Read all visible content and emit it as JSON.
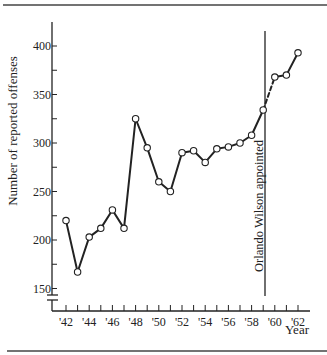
{
  "chart_data": {
    "type": "line",
    "title": "",
    "xlabel": "Year",
    "ylabel": "Number of reported offenses",
    "x": [
      1942,
      1943,
      1944,
      1945,
      1946,
      1947,
      1948,
      1949,
      1950,
      1951,
      1952,
      1953,
      1954,
      1955,
      1956,
      1957,
      1958,
      1959,
      1960,
      1961,
      1962
    ],
    "series": [
      {
        "name": "Reported offenses",
        "values": [
          220,
          167,
          203,
          212,
          231,
          212,
          325,
          295,
          260,
          250,
          290,
          292,
          280,
          294,
          296,
          300,
          308,
          334,
          368,
          370,
          393
        ],
        "dashed_segment": [
          1959,
          1960
        ],
        "marker": "open-circle"
      }
    ],
    "xticks": [
      1942,
      1943,
      1944,
      1945,
      1946,
      1947,
      1948,
      1949,
      1950,
      1951,
      1952,
      1953,
      1954,
      1955,
      1956,
      1957,
      1958,
      1959,
      1960,
      1961,
      1962
    ],
    "xtick_labels": [
      "'42",
      "'44",
      "'46",
      "'48",
      "'50",
      "'52",
      "'54",
      "'56",
      "'58",
      "'60",
      "'62"
    ],
    "xtick_label_years": [
      1942,
      1944,
      1946,
      1948,
      1950,
      1952,
      1954,
      1956,
      1958,
      1960,
      1962
    ],
    "yticks": [
      150,
      175,
      200,
      225,
      250,
      275,
      300,
      325,
      350,
      375,
      400
    ],
    "ytick_labels": [
      "150",
      "200",
      "250",
      "300",
      "350",
      "400"
    ],
    "ytick_label_values": [
      150,
      200,
      250,
      300,
      350,
      400
    ],
    "ylim": [
      150,
      415
    ],
    "y_axis_break": true,
    "grid": false,
    "legend": null,
    "annotations": [
      {
        "type": "vline",
        "x": 1959.5,
        "text": "Orlando Wilson appointed",
        "orientation": "vertical"
      }
    ]
  },
  "colors": {
    "ink": "#222222",
    "background": "#ffffff"
  }
}
